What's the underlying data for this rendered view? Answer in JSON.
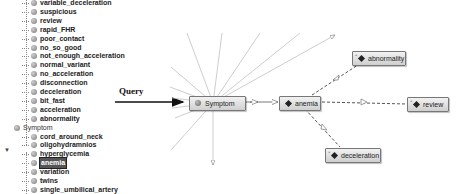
{
  "tree": {
    "items": [
      {
        "label": "variable_deceleration",
        "level": "child"
      },
      {
        "label": "suspicious",
        "level": "child"
      },
      {
        "label": "review",
        "level": "child"
      },
      {
        "label": "rapid_FHR",
        "level": "child"
      },
      {
        "label": "poor_contact",
        "level": "child"
      },
      {
        "label": "no_so_good",
        "level": "child"
      },
      {
        "label": "not_enough_acceleration",
        "level": "child"
      },
      {
        "label": "normal_variant",
        "level": "child"
      },
      {
        "label": "no_acceleration",
        "level": "child"
      },
      {
        "label": "disconnection",
        "level": "child"
      },
      {
        "label": "deceleration",
        "level": "child"
      },
      {
        "label": "bit_fast",
        "level": "child"
      },
      {
        "label": "acceleration",
        "level": "child"
      },
      {
        "label": "abnormality",
        "level": "child"
      },
      {
        "label": "Symptom",
        "level": "parent"
      },
      {
        "label": "cord_around_neck",
        "level": "child"
      },
      {
        "label": "oligohydramnios",
        "level": "child"
      },
      {
        "label": "hyperglycemia",
        "level": "child"
      },
      {
        "label": "anemia",
        "level": "child",
        "selected": true
      },
      {
        "label": "variation",
        "level": "child"
      },
      {
        "label": "twins",
        "level": "child"
      },
      {
        "label": "single_umbilical_artery",
        "level": "child"
      },
      {
        "label": "pain",
        "level": "child"
      },
      {
        "label": "reason_uptake",
        "level": "child"
      }
    ],
    "expander": "▼"
  },
  "annotation": {
    "query_label": "Query"
  },
  "graph": {
    "nodes": {
      "symptom": {
        "label": "Symptom",
        "icon": "class-circle"
      },
      "anemia": {
        "label": "anemia",
        "icon": "individual-diamond"
      },
      "abnormality": {
        "label": "abnormality",
        "icon": "individual-diamond"
      },
      "review": {
        "label": "review",
        "icon": "individual-diamond"
      },
      "deceleration": {
        "label": "deceleration",
        "icon": "individual-diamond"
      }
    },
    "corner_mark": "+"
  }
}
